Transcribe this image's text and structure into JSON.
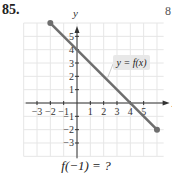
{
  "problem": {
    "number": "85.",
    "edge_mark": "8",
    "question": "f(−1) = ?"
  },
  "chart_data": {
    "type": "line",
    "title": "",
    "xlabel": "x",
    "ylabel": "y",
    "function_label": "y = f(x)",
    "xlim": [
      -4,
      6.5
    ],
    "ylim": [
      -4,
      6
    ],
    "grid": true,
    "x_ticks": [
      -3,
      -2,
      -1,
      1,
      2,
      3,
      4,
      5
    ],
    "y_ticks": [
      -3,
      -2,
      -1,
      1,
      2,
      3,
      4,
      5
    ],
    "series": [
      {
        "name": "f(x)",
        "x": [
          -2,
          6
        ],
        "y": [
          6,
          -2
        ],
        "endpoints": "closed-dots",
        "color": "#6e6e6e"
      }
    ],
    "equation": "y = 4 - x"
  },
  "colors": {
    "line": "#6e6e6e",
    "grid": "#e6e6e6",
    "axis": "#333333",
    "label_bg": "#e8e8e8"
  }
}
